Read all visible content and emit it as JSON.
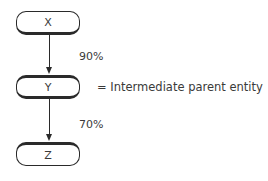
{
  "diagram": {
    "type": "ownership-chain",
    "nodes": [
      {
        "id": "X",
        "label": "X"
      },
      {
        "id": "Y",
        "label": "Y"
      },
      {
        "id": "Z",
        "label": "Z"
      }
    ],
    "edges": [
      {
        "from": "X",
        "to": "Y",
        "label": "90%"
      },
      {
        "from": "Y",
        "to": "Z",
        "label": "70%"
      }
    ],
    "legend": {
      "text": "= Intermediate parent entity",
      "refers_to": "Y"
    }
  },
  "colors": {
    "line": "#2a2a2a",
    "text": "#3a3a3a",
    "background": "#ffffff"
  }
}
